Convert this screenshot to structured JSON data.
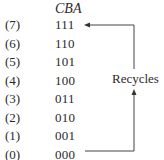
{
  "header": {
    "column_label": "CBA"
  },
  "rows": [
    {
      "label": "(7)",
      "code": "111"
    },
    {
      "label": "(6)",
      "code": "110"
    },
    {
      "label": "(5)",
      "code": "101"
    },
    {
      "label": "(4)",
      "code": "100"
    },
    {
      "label": "(3)",
      "code": "011"
    },
    {
      "label": "(2)",
      "code": "010"
    },
    {
      "label": "(1)",
      "code": "001"
    },
    {
      "label": "(0)",
      "code": "000"
    }
  ],
  "annotation": {
    "text": "Recycles",
    "from_state": "000",
    "to_state": "111"
  },
  "colors": {
    "text": "#2a2a2a",
    "line": "#444444"
  }
}
